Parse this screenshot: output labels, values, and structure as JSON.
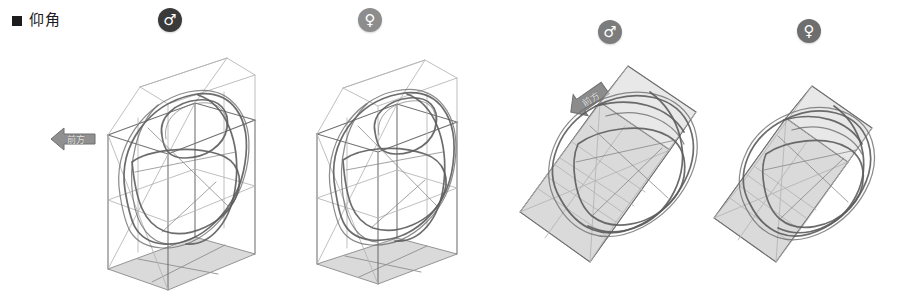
{
  "page": {
    "background_color": "#ffffff",
    "width": 910,
    "height": 307
  },
  "header": {
    "bullet": "square-bullet",
    "title": "仰角"
  },
  "labels": {
    "male_symbol": "♂",
    "female_symbol": "♀",
    "direction_forward": "前方"
  },
  "colors": {
    "badge_male": "#3a3a3a",
    "badge_female": "#8d8d8d",
    "badge_male_light": "#7c7c7c",
    "badge_female_dark": "#6e6e6e",
    "pencil_stroke": "#5c5c5c",
    "construction_line": "#8e8e8e",
    "shaded_plane": "#cfcfcf",
    "arrow_fill": "#8c8c8c",
    "text": "#1c1c1c"
  },
  "figures": [
    {
      "id": "figure-1",
      "sex": "male",
      "badge": "♂",
      "orientation": "upright",
      "shaded_plane": "floor",
      "description": "pelvis sketch inside upright 3d construction box"
    },
    {
      "id": "figure-2",
      "sex": "female",
      "badge": "♀",
      "orientation": "upright",
      "shaded_plane": "floor",
      "description": "pelvis sketch inside upright 3d construction box"
    },
    {
      "id": "figure-3",
      "sex": "male",
      "badge": "♂",
      "orientation": "tilted",
      "shaded_plane": "side",
      "description": "pelvis sketch inside tilted 3d construction box"
    },
    {
      "id": "figure-4",
      "sex": "female",
      "badge": "♀",
      "orientation": "tilted",
      "shaded_plane": "side",
      "description": "pelvis sketch inside tilted 3d construction box"
    }
  ],
  "annotations": [
    {
      "id": "arrow-1",
      "label": "前方",
      "direction": "left"
    },
    {
      "id": "arrow-2",
      "label": "前方",
      "direction": "up-left"
    }
  ]
}
